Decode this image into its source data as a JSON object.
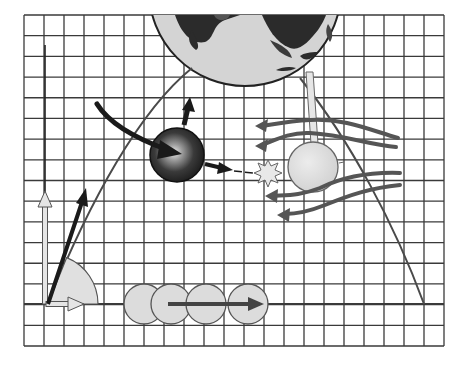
{
  "figure": {
    "colors": {
      "background": "#ffffff",
      "grid": "#3a3a3a",
      "trajectory": "#4a4a4a",
      "dark_arrow": "#1a1a1a",
      "light_fill": "#d9d9d9",
      "light_stroke": "#5a5a5a",
      "wave_arrow": "#555555",
      "earth_land": "#2b2b2b",
      "earth_ocean": "#d4d4d4"
    },
    "grid": {
      "x0": 24,
      "y0": 15,
      "x1": 444,
      "y1": 346,
      "step_x": 20.1,
      "step_y": 20.7,
      "cols": 21,
      "rows": 16
    },
    "earth": {
      "cx": 245,
      "cy": -10,
      "r": 96,
      "clip_top": 15
    },
    "trajectory": {
      "start": [
        48,
        304
      ],
      "points": [
        [
          48,
          304
        ],
        [
          75,
          240
        ],
        [
          100,
          190
        ],
        [
          130,
          140
        ],
        [
          160,
          100
        ],
        [
          192,
          68
        ]
      ],
      "right_points": [
        [
          300,
          78
        ],
        [
          325,
          108
        ],
        [
          345,
          140
        ],
        [
          368,
          185
        ],
        [
          390,
          230
        ],
        [
          408,
          268
        ],
        [
          424,
          304
        ]
      ]
    },
    "ground_line": {
      "y": 304,
      "x_start": 24,
      "x_end": 444
    },
    "launch": {
      "origin": [
        46,
        304
      ],
      "vertical_arrow_tip": [
        45,
        193
      ],
      "horizontal_arrow_tip": [
        82,
        304
      ],
      "velocity_arrow_tip": [
        86,
        190
      ],
      "angle_wedge_radius": 50,
      "angle_deg": 68
    },
    "dark_ball": {
      "cx": 177,
      "cy": 155,
      "r": 27
    },
    "light_sphere": {
      "cx": 313,
      "cy": 167,
      "r": 25
    },
    "starburst": {
      "cx": 268,
      "cy": 173
    },
    "rolling_balls": [
      {
        "cx": 144,
        "cy": 304,
        "r": 20
      },
      {
        "cx": 171,
        "cy": 304,
        "r": 20
      },
      {
        "cx": 206,
        "cy": 304,
        "r": 20
      },
      {
        "cx": 248,
        "cy": 304,
        "r": 20
      }
    ],
    "rolling_arrow": {
      "x_start": 168,
      "x_end": 262,
      "y": 304
    },
    "labels": []
  }
}
